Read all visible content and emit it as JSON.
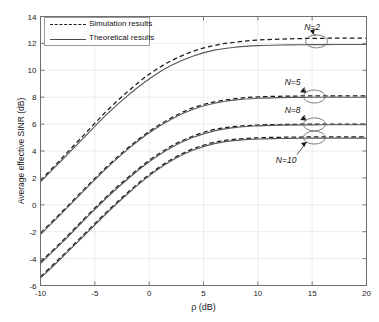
{
  "chart_data": {
    "type": "line",
    "title": "",
    "xlabel": "ρ (dB)",
    "ylabel": "Average effective SINR (dB)",
    "xlim": [
      -10,
      20
    ],
    "ylim": [
      -6,
      14
    ],
    "xticks": [
      -10,
      -5,
      0,
      5,
      10,
      15,
      20
    ],
    "yticks": [
      -6,
      -4,
      -2,
      0,
      2,
      4,
      6,
      8,
      10,
      12,
      14
    ],
    "grid": true,
    "legend_position": "upper-left",
    "legend": [
      {
        "label": "Simulation results",
        "style": "dashed"
      },
      {
        "label": "Theoretical results",
        "style": "solid"
      }
    ],
    "x": [
      -10,
      -8,
      -6,
      -4,
      -2,
      0,
      2,
      4,
      6,
      8,
      10,
      12,
      14,
      16,
      18,
      20
    ],
    "series": [
      {
        "name": "Simulation results N=2",
        "style": "dashed",
        "group": "N=2",
        "values": [
          1.8,
          3.5,
          5.2,
          6.9,
          8.4,
          9.7,
          10.7,
          11.4,
          11.85,
          12.1,
          12.25,
          12.32,
          12.36,
          12.38,
          12.4,
          12.4
        ]
      },
      {
        "name": "Theoretical results N=2",
        "style": "solid",
        "group": "N=2",
        "values": [
          1.7,
          3.35,
          5.0,
          6.65,
          8.1,
          9.35,
          10.35,
          11.05,
          11.5,
          11.72,
          11.83,
          11.88,
          11.9,
          11.91,
          11.92,
          11.92
        ]
      },
      {
        "name": "Simulation results N=5",
        "style": "dashed",
        "group": "N=5",
        "values": [
          -2.1,
          -0.5,
          1.15,
          2.75,
          4.2,
          5.45,
          6.45,
          7.2,
          7.65,
          7.9,
          8.02,
          8.07,
          8.09,
          8.1,
          8.1,
          8.1
        ]
      },
      {
        "name": "Theoretical results N=5",
        "style": "solid",
        "group": "N=5",
        "values": [
          -2.2,
          -0.6,
          1.05,
          2.65,
          4.1,
          5.35,
          6.35,
          7.08,
          7.55,
          7.8,
          7.92,
          7.97,
          7.99,
          8.0,
          8.0,
          8.0
        ]
      },
      {
        "name": "Simulation results N=8",
        "style": "dashed",
        "group": "N=8",
        "values": [
          -4.25,
          -2.7,
          -1.05,
          0.55,
          2.0,
          3.3,
          4.35,
          5.1,
          5.6,
          5.83,
          5.93,
          5.97,
          5.99,
          6.0,
          6.0,
          6.0
        ]
      },
      {
        "name": "Theoretical results N=8",
        "style": "solid",
        "group": "N=8",
        "values": [
          -4.35,
          -2.8,
          -1.15,
          0.45,
          1.9,
          3.2,
          4.25,
          5.0,
          5.5,
          5.76,
          5.87,
          5.92,
          5.94,
          5.95,
          5.95,
          5.95
        ]
      },
      {
        "name": "Simulation results N=10",
        "style": "dashed",
        "group": "N=10",
        "values": [
          -5.35,
          -3.8,
          -2.2,
          -0.6,
          0.9,
          2.25,
          3.35,
          4.15,
          4.65,
          4.88,
          4.98,
          5.02,
          5.04,
          5.05,
          5.05,
          5.05
        ]
      },
      {
        "name": "Theoretical results N=10",
        "style": "solid",
        "group": "N=10",
        "values": [
          -5.45,
          -3.9,
          -2.3,
          -0.7,
          0.8,
          2.15,
          3.25,
          4.05,
          4.55,
          4.79,
          4.89,
          4.93,
          4.95,
          4.96,
          4.96,
          4.96
        ]
      }
    ],
    "annotations": [
      {
        "text": "N=2",
        "label_x": 15.0,
        "label_y": 13.25,
        "marker_x": 15.4,
        "marker_y": 12.15
      },
      {
        "text": "N=5",
        "label_x": 13.2,
        "label_y": 9.1,
        "marker_x": 15.2,
        "marker_y": 8.05
      },
      {
        "text": "N=8",
        "label_x": 13.2,
        "label_y": 7.05,
        "marker_x": 15.2,
        "marker_y": 5.98
      },
      {
        "text": "N=10",
        "label_x": 12.6,
        "label_y": 3.3,
        "marker_x": 15.2,
        "marker_y": 5.0
      }
    ]
  },
  "axis": {
    "xlabel": "ρ (dB)",
    "ylabel": "Average effective SINR (dB)",
    "xticklabels": [
      "-10",
      "-5",
      "0",
      "5",
      "10",
      "15",
      "20"
    ],
    "yticklabels": [
      "-6",
      "-4",
      "-2",
      "0",
      "2",
      "4",
      "6",
      "8",
      "10",
      "12",
      "14"
    ]
  },
  "legend": {
    "simulation_label": "Simulation results",
    "theoretical_label": "Theoretical results"
  },
  "annotation_labels": {
    "n2": "N=2",
    "n5": "N=5",
    "n8": "N=8",
    "n10": "N=10"
  },
  "colors": {
    "axis": "#6e6e6e",
    "grid": "#e2e2e2",
    "simulation": "#1a1a1a",
    "theoretical": "#585858",
    "annotation": "#111111",
    "background": "#ffffff"
  }
}
